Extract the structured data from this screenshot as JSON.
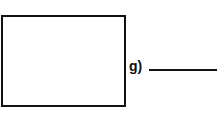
{
  "worksheet": {
    "item": {
      "label": "g)",
      "answer_value": "",
      "box_content": ""
    }
  }
}
